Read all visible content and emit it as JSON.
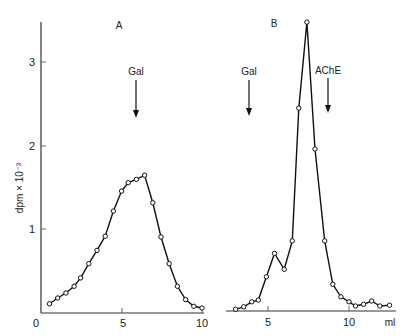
{
  "chart_data": [
    {
      "panel": "A",
      "type": "line",
      "title": "A",
      "xlabel": "",
      "ylabel": "dpm × 10⁻³",
      "xlim": [
        0,
        10
      ],
      "ylim": [
        0,
        3.5
      ],
      "xticks": [
        0,
        5,
        10
      ],
      "yticks": [
        1,
        2,
        3
      ],
      "grid": false,
      "markers": "open-circle",
      "annotations": [
        {
          "label": "Gal",
          "x": 6.0,
          "type": "down-arrow"
        }
      ],
      "x": [
        0.7,
        1.2,
        1.7,
        2.2,
        2.6,
        3.1,
        3.6,
        4.1,
        4.6,
        5.1,
        5.5,
        6.0,
        6.5,
        7.0,
        7.5,
        8.0,
        8.5,
        9.0,
        9.5,
        10.0
      ],
      "values": [
        0.11,
        0.18,
        0.24,
        0.32,
        0.42,
        0.59,
        0.75,
        0.92,
        1.22,
        1.46,
        1.56,
        1.6,
        1.65,
        1.32,
        0.91,
        0.59,
        0.32,
        0.16,
        0.08,
        0.06
      ]
    },
    {
      "panel": "B",
      "type": "line",
      "title": "B",
      "xlabel": "ml",
      "ylabel": "dpm × 10⁻³",
      "xlim": [
        2.4,
        12.9
      ],
      "ylim": [
        0,
        3.5
      ],
      "xticks": [
        5,
        10
      ],
      "grid": false,
      "markers": "open-circle",
      "annotations": [
        {
          "label": "Gal",
          "x": 3.8,
          "type": "down-arrow"
        },
        {
          "label": "AChE",
          "x": 8.7,
          "type": "down-arrow"
        }
      ],
      "x": [
        3.0,
        3.5,
        4.0,
        4.4,
        4.9,
        5.4,
        6.0,
        6.5,
        6.9,
        7.4,
        7.9,
        8.5,
        9.0,
        9.5,
        10.0,
        10.4,
        10.9,
        11.4,
        11.9,
        12.5
      ],
      "values": [
        0.02,
        0.05,
        0.11,
        0.13,
        0.41,
        0.69,
        0.5,
        0.84,
        2.43,
        3.46,
        1.94,
        0.84,
        0.32,
        0.17,
        0.11,
        0.06,
        0.08,
        0.12,
        0.06,
        0.07
      ]
    }
  ],
  "labels": {
    "panel_a": "A",
    "panel_b": "B",
    "y_axis": "dpm × 10⁻³",
    "x_unit": "ml",
    "gal_a": "Gal",
    "gal_b": "Gal",
    "ache": "AChE",
    "origin": "0",
    "ytick_1": "1",
    "ytick_2": "2",
    "ytick_3": "3",
    "a_xtick_5": "5",
    "a_xtick_10": "10",
    "b_xtick_5": "5",
    "b_xtick_10": "10"
  },
  "colors": {
    "line": "#111111",
    "axis": "#333333",
    "background": "#ffffff"
  }
}
